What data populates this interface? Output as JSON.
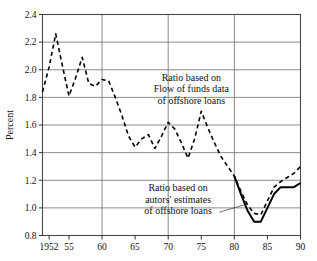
{
  "chart_data": {
    "type": "line",
    "title": "",
    "xlabel": "",
    "ylabel": "Percent",
    "xlim": [
      1951,
      1990
    ],
    "ylim": [
      0.8,
      2.4
    ],
    "grid": true,
    "legend_position": "inline-annotations",
    "y_ticks": [
      "0.8",
      "1.0",
      "1.2",
      "1.4",
      "1.6",
      "1.8",
      "2.0",
      "2.2",
      "2.4"
    ],
    "y_tick_values": [
      0.8,
      1.0,
      1.2,
      1.4,
      1.6,
      1.8,
      2.0,
      2.2,
      2.4
    ],
    "x_ticks": [
      "1952",
      "55",
      "60",
      "65",
      "70",
      "75",
      "80",
      "85",
      "90"
    ],
    "x_tick_values": [
      1952,
      1955,
      1960,
      1965,
      1970,
      1975,
      1980,
      1985,
      1990
    ],
    "x_gridlines": [
      1960,
      1970,
      1980,
      1990
    ],
    "series": [
      {
        "name": "Ratio based on Flow of funds data of offshore loans",
        "style": "dashed",
        "color": "#000000",
        "x": [
          1951,
          1952,
          1953,
          1954,
          1955,
          1956,
          1957,
          1958,
          1959,
          1960,
          1961,
          1962,
          1963,
          1964,
          1965,
          1966,
          1967,
          1968,
          1969,
          1970,
          1971,
          1972,
          1973,
          1974,
          1975,
          1976,
          1977,
          1978,
          1979,
          1980,
          1981,
          1982,
          1983,
          1984,
          1985,
          1986,
          1987,
          1988,
          1989,
          1990
        ],
        "values": [
          1.84,
          2.02,
          2.26,
          2.03,
          1.81,
          1.94,
          2.09,
          1.9,
          1.88,
          1.93,
          1.92,
          1.8,
          1.67,
          1.52,
          1.44,
          1.5,
          1.53,
          1.43,
          1.52,
          1.62,
          1.57,
          1.47,
          1.36,
          1.5,
          1.7,
          1.58,
          1.47,
          1.37,
          1.3,
          1.23,
          1.12,
          1.02,
          0.96,
          0.95,
          1.05,
          1.15,
          1.19,
          1.22,
          1.25,
          1.3
        ]
      },
      {
        "name": "Ratio based on autors' estimates of offshore loans",
        "style": "solid",
        "color": "#000000",
        "x": [
          1980,
          1981,
          1982,
          1983,
          1984,
          1985,
          1986,
          1987,
          1988,
          1989,
          1990
        ],
        "values": [
          1.23,
          1.1,
          0.98,
          0.9,
          0.9,
          1.0,
          1.1,
          1.15,
          1.15,
          1.15,
          1.18
        ]
      }
    ],
    "annotations": [
      {
        "id": "annotation-flow-of-funds",
        "lines": [
          "Ratio based on",
          "Flow of funds data",
          "of offshore loans"
        ],
        "anchor_x": 1973.5,
        "anchor_y": 1.92
      },
      {
        "id": "annotation-authors-estimates",
        "lines": [
          "Ratio based on",
          "autors' estimates",
          "of offshore loans"
        ],
        "anchor_x": 1971.5,
        "anchor_y": 1.12,
        "leader_line": true
      }
    ]
  }
}
